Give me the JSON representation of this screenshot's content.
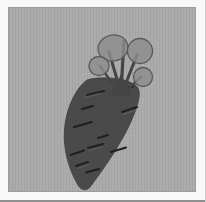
{
  "figure": {
    "leaf_count": 4,
    "texture_mark_count": 11,
    "stripe_direction": "vertical"
  },
  "palette": {
    "frame-white": "#f8f8f8",
    "frame-bottom-line": "#8f8f8f",
    "panel-edge": "#9e9e9e",
    "bg-stripe-dark": "#a4a4a4",
    "bg-stripe-light": "#adadad",
    "carrot-body": "#4a4a4a",
    "carrot-mark": "#1f1f1f",
    "carrot-highlight": "#616161",
    "leaf-fill": "#8c8c8c",
    "leaf-edge": "#5a5a5a",
    "stem": "#454545"
  }
}
